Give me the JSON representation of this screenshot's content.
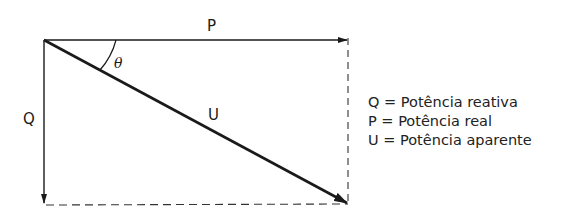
{
  "diagram": {
    "type": "power-triangle",
    "vectors": {
      "P": {
        "label": "P",
        "from": [
          44,
          40
        ],
        "to": [
          348,
          40
        ]
      },
      "Q": {
        "label": "Q",
        "from": [
          44,
          40
        ],
        "to": [
          44,
          203
        ]
      },
      "U": {
        "label": "U",
        "from": [
          44,
          40
        ],
        "to": [
          348,
          203
        ]
      }
    },
    "angle_label": "θ",
    "legend": [
      {
        "symbol": "Q",
        "eq": "=",
        "text": "Potência reativa"
      },
      {
        "symbol": "P",
        "eq": "=",
        "text": "Potência real"
      },
      {
        "symbol": "U",
        "eq": "=",
        "text": "Potência aparente"
      }
    ],
    "colors": {
      "line": "#1a1a1a",
      "background": "#ffffff"
    }
  }
}
